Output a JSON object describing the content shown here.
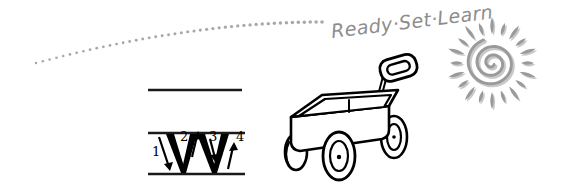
{
  "canvas": {
    "width": 567,
    "height": 189,
    "background": "#ffffff"
  },
  "colors": {
    "ink_black": "#000000",
    "pencil_gray": "#8d8d8d",
    "dot_gray": "#a8a8a8",
    "sun_gray": "#9a9a9a",
    "sun_shadow": "#c9c9c9",
    "rule_line": "#1a1a1a"
  },
  "headline": {
    "text": "Ready·Set·Learn",
    "words": [
      "Ready",
      "Set",
      "Learn"
    ],
    "separator": "·",
    "color": "#8d8d8d",
    "style": "handwritten-script",
    "rotation_deg": -7,
    "font_size_px": 19
  },
  "dot_trail": {
    "name": "dotted-swoosh-trail",
    "color": "#a8a8a8",
    "dot_count": 46,
    "dot_radius_px": 1.7,
    "description": "curved dotted path sweeping up from lower-left to the headline"
  },
  "sun": {
    "name": "spiral-sun",
    "color": "#9a9a9a",
    "shadow_color": "#c9c9c9",
    "center_x": 492,
    "center_y": 63,
    "spiral_turns": 2.6,
    "ray_count": 20,
    "ray_shape": "teardrop"
  },
  "letter_practice": {
    "name": "letter-w-stroke-guide",
    "letter": "W",
    "letter_case": "uppercase",
    "stroke_count": 4,
    "strokes": [
      {
        "number": "1",
        "direction": "down-right",
        "arrow": "↘"
      },
      {
        "number": "2",
        "direction": "up-right",
        "arrow": "↗"
      },
      {
        "number": "3",
        "direction": "down-right",
        "arrow": "↘"
      },
      {
        "number": "4",
        "direction": "up-right",
        "arrow": "↗"
      }
    ],
    "guide_lines": [
      {
        "name": "cap-line",
        "y": 90
      },
      {
        "name": "mid-line",
        "y": 133
      },
      {
        "name": "base-line",
        "y": 174
      }
    ],
    "color": "#000000"
  },
  "wagon": {
    "name": "toy-wagon-illustration",
    "line_color": "#000000",
    "fill_color": "#ffffff",
    "wheel_count": 4,
    "has_handle": true,
    "handle_grip_shape": "rounded-rectangle",
    "bed_shape": "perspective-parallelogram"
  }
}
